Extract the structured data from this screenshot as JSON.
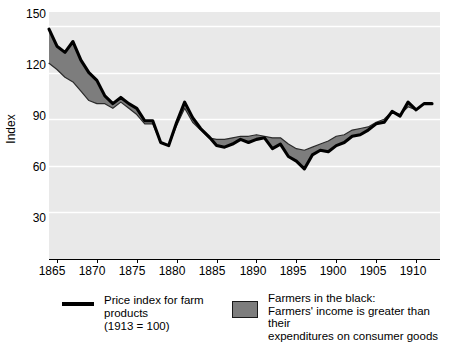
{
  "chart_data": {
    "type": "area",
    "title": "",
    "xlabel": "",
    "ylabel": "Index",
    "xlim": [
      1864,
      1913
    ],
    "ylim": [
      0,
      159
    ],
    "grid": true,
    "grid_color": "#ffffff",
    "plot_background": "#e9e9e9",
    "yticks": [
      150,
      120,
      90,
      60,
      30
    ],
    "xticks": [
      1865,
      1870,
      1875,
      1880,
      1885,
      1890,
      1895,
      1900,
      1905,
      1910
    ],
    "series": [
      {
        "name": "Price index for farm products (1913 = 100)",
        "color": "#000000",
        "x": [
          1864,
          1865,
          1866,
          1867,
          1868,
          1869,
          1870,
          1871,
          1872,
          1873,
          1874,
          1875,
          1876,
          1877,
          1878,
          1879,
          1880,
          1881,
          1882,
          1883,
          1884,
          1885,
          1886,
          1887,
          1888,
          1889,
          1890,
          1891,
          1892,
          1893,
          1894,
          1895,
          1896,
          1897,
          1898,
          1899,
          1900,
          1901,
          1902,
          1903,
          1904,
          1905,
          1906,
          1907,
          1908,
          1909,
          1910,
          1911,
          1912
        ],
        "values": [
          148,
          137,
          133,
          140,
          128,
          120,
          115,
          105,
          100,
          104,
          100,
          97,
          89,
          89,
          75,
          73,
          88,
          101,
          91,
          84,
          79,
          73,
          72,
          74,
          77,
          75,
          77,
          78,
          71,
          74,
          66,
          63,
          58,
          67,
          70,
          69,
          73,
          75,
          79,
          80,
          83,
          87,
          88,
          95,
          92,
          101,
          96,
          100,
          100
        ]
      },
      {
        "name": "Farmers in the black: Farmers' income is greater than their expenditures on consumer goods",
        "color": "#7d7d7d",
        "x": [
          1864,
          1865,
          1866,
          1867,
          1868,
          1869,
          1870,
          1871,
          1872,
          1873,
          1874,
          1875,
          1876,
          1877,
          1878,
          1879,
          1880,
          1881,
          1882,
          1883,
          1884,
          1885,
          1886,
          1887,
          1888,
          1889,
          1890,
          1891,
          1892,
          1893,
          1894,
          1895,
          1896,
          1897,
          1898,
          1899,
          1900,
          1901,
          1902,
          1903,
          1904,
          1905,
          1906,
          1907,
          1908,
          1909,
          1910,
          1911,
          1912
        ],
        "values": [
          126,
          122,
          117,
          114,
          108,
          102,
          100,
          100,
          97,
          101,
          97,
          93,
          87,
          87,
          75,
          73,
          86,
          97,
          88,
          83,
          78,
          77,
          77,
          78,
          79,
          79,
          80,
          79,
          78,
          78,
          74,
          71,
          70,
          72,
          74,
          76,
          79,
          80,
          83,
          84,
          85,
          88,
          90,
          95,
          93,
          98,
          96,
          100,
          100
        ]
      }
    ],
    "annotation": "Shaded band marks years when farmers' income exceeded consumer-goods expenditures."
  },
  "axes": {
    "y_title": "Index",
    "y_tick_labels": [
      "150",
      "120",
      "90",
      "60",
      "30"
    ],
    "x_tick_labels": [
      "1865",
      "1870",
      "1875",
      "1880",
      "1885",
      "1890",
      "1895",
      "1900",
      "1905",
      "1910"
    ]
  },
  "legend": {
    "line_entry": {
      "label": "Price index for farm products\n(1913 = 100)",
      "swatch_name": "black-line-swatch",
      "color": "#000000"
    },
    "area_entry": {
      "label": "Farmers in the black:\nFarmers' income is greater than their\nexpenditures on consumer goods",
      "swatch_name": "gray-area-swatch",
      "color": "#7d7d7d"
    }
  }
}
